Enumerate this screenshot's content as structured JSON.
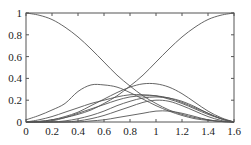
{
  "chart_data": {
    "type": "line",
    "title": "",
    "xlabel": "",
    "ylabel": "",
    "xlim": [
      0,
      1.6
    ],
    "ylim": [
      0,
      1
    ],
    "grid": false,
    "legend": null,
    "x_ticks": [
      "0",
      "0.2",
      "0.4",
      "0.6",
      "0.8",
      "1",
      "1.2",
      "1.4",
      "1.6"
    ],
    "y_ticks": [
      "0",
      "0.2",
      "0.4",
      "0.6",
      "0.8",
      "1"
    ],
    "x": [
      0,
      0.1,
      0.2,
      0.3,
      0.4,
      0.5,
      0.6,
      0.7,
      0.8,
      0.9,
      1.0,
      1.1,
      1.2,
      1.3,
      1.4,
      1.5,
      1.6
    ],
    "series": [
      {
        "name": "decreasing",
        "values": [
          1.0,
          0.98,
          0.94,
          0.87,
          0.78,
          0.67,
          0.55,
          0.43,
          0.33,
          0.24,
          0.17,
          0.11,
          0.07,
          0.04,
          0.02,
          0.005,
          0.0
        ]
      },
      {
        "name": "increasing",
        "values": [
          0.0,
          0.005,
          0.02,
          0.04,
          0.07,
          0.11,
          0.17,
          0.24,
          0.33,
          0.43,
          0.55,
          0.67,
          0.78,
          0.87,
          0.94,
          0.98,
          1.0
        ]
      },
      {
        "name": "bump-early",
        "values": [
          0.02,
          0.06,
          0.11,
          0.17,
          0.28,
          0.34,
          0.34,
          0.32,
          0.27,
          0.21,
          0.15,
          0.1,
          0.06,
          0.03,
          0.015,
          0.005,
          0.0
        ]
      },
      {
        "name": "bump-late",
        "values": [
          0.0,
          0.005,
          0.02,
          0.05,
          0.09,
          0.15,
          0.21,
          0.27,
          0.32,
          0.35,
          0.35,
          0.32,
          0.26,
          0.18,
          0.1,
          0.04,
          0.0
        ]
      },
      {
        "name": "mid-1",
        "values": [
          0.0,
          0.02,
          0.05,
          0.09,
          0.13,
          0.17,
          0.2,
          0.23,
          0.25,
          0.25,
          0.24,
          0.21,
          0.17,
          0.12,
          0.07,
          0.03,
          0.0
        ]
      },
      {
        "name": "mid-2",
        "values": [
          0.0,
          0.0,
          0.01,
          0.04,
          0.08,
          0.12,
          0.16,
          0.2,
          0.23,
          0.24,
          0.24,
          0.22,
          0.18,
          0.13,
          0.08,
          0.03,
          0.0
        ]
      },
      {
        "name": "mid-3",
        "values": [
          0.0,
          0.0,
          0.0,
          0.01,
          0.03,
          0.06,
          0.1,
          0.15,
          0.19,
          0.22,
          0.23,
          0.22,
          0.19,
          0.14,
          0.08,
          0.03,
          0.0
        ]
      },
      {
        "name": "low-1",
        "values": [
          0.0,
          0.0,
          0.0,
          0.0,
          0.01,
          0.03,
          0.06,
          0.1,
          0.14,
          0.18,
          0.2,
          0.19,
          0.15,
          0.1,
          0.05,
          0.015,
          0.0
        ]
      },
      {
        "name": "low-2",
        "values": [
          0.0,
          0.0,
          0.0,
          0.0,
          0.0,
          0.01,
          0.02,
          0.04,
          0.06,
          0.08,
          0.1,
          0.1,
          0.08,
          0.05,
          0.02,
          0.005,
          0.0
        ]
      }
    ]
  },
  "style": {
    "line_color": "#555555",
    "axis_color": "#555555",
    "background": "#ffffff"
  }
}
